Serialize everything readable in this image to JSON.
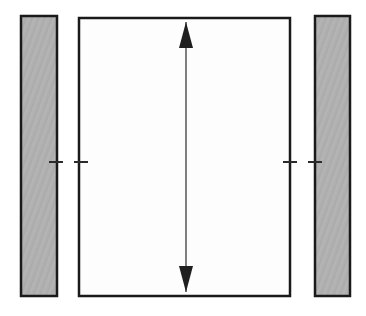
{
  "canvas": {
    "width": 366,
    "height": 316,
    "background_color": "#ffffff",
    "title": "Vertical clearance dimension diagram"
  },
  "colors": {
    "stroke": "#1a1a1a",
    "gray_fill": "#b0b0b0",
    "white_fill": "#fdfdfd",
    "arrow": "#2b2b2b",
    "tick": "#2b2b2b"
  },
  "shapes": {
    "left_block": {
      "label": "left-block",
      "x": 21,
      "y": 16,
      "width": 36,
      "height": 280,
      "fill": "#b0b0b0",
      "stroke": "#1a1a1a",
      "stroke_width": 2.5,
      "texture": "noise"
    },
    "center_panel": {
      "label": "center-panel",
      "x": 79,
      "y": 18,
      "width": 211,
      "height": 278,
      "fill": "#fdfdfd",
      "stroke": "#1a1a1a",
      "stroke_width": 2.5,
      "texture": "none"
    },
    "right_block": {
      "label": "right-block",
      "x": 315,
      "y": 16,
      "width": 35,
      "height": 280,
      "fill": "#b0b0b0",
      "stroke": "#1a1a1a",
      "stroke_width": 2.5,
      "texture": "noise"
    }
  },
  "dimension_arrow": {
    "label": "vertical-dimension-arrow",
    "orientation": "vertical",
    "double_headed": true,
    "x": 186,
    "y_top": 22,
    "y_bottom": 292,
    "length": 270,
    "shaft_width": 1.2,
    "head_width": 14,
    "head_length": 26,
    "color": "#2b2b2b",
    "annotation": ""
  },
  "center_ticks": {
    "label": "centerline-ticks",
    "y": 162,
    "thickness": 2,
    "color": "#2b2b2b",
    "marks": [
      {
        "name": "tick-left-outer",
        "x1": 49,
        "x2": 63
      },
      {
        "name": "tick-left-inner",
        "x1": 74,
        "x2": 88
      },
      {
        "name": "tick-right-inner",
        "x1": 283,
        "x2": 297
      },
      {
        "name": "tick-right-outer",
        "x1": 308,
        "x2": 322
      }
    ]
  },
  "labels": {
    "figure_caption": "",
    "dimension_text": ""
  }
}
